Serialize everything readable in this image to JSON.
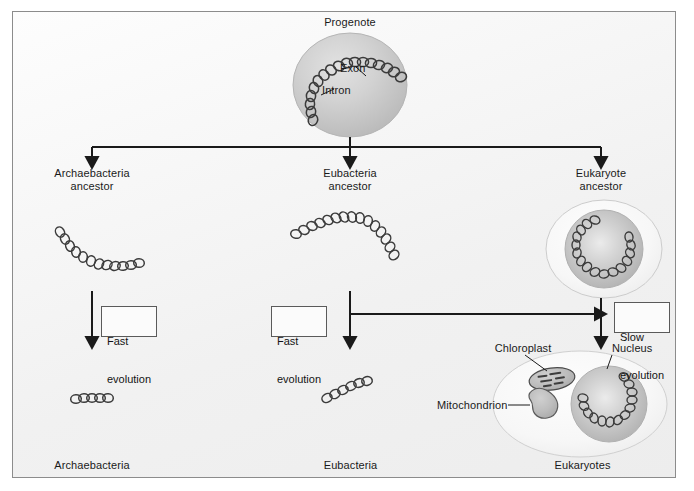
{
  "diagram": {
    "background_color": "#f2f2f2",
    "frame_border_color": "#8c8c8c",
    "arrow_color": "#1a1a1a",
    "cell_fill_color": "#c9c9c9",
    "dna_color": "#3a3a3a"
  },
  "root": {
    "label": "Progenote",
    "parts": [
      {
        "name": "exon",
        "label": "Exon"
      },
      {
        "name": "intron",
        "label": "Intron"
      }
    ]
  },
  "branches": [
    {
      "id": "archaebacteria",
      "ancestor_label": "Archaebacteria\nancestor",
      "ancestor_line1": "Archaebacteria",
      "ancestor_line2": "ancestor",
      "evolution_label": "Fast\nevolution",
      "evolution_line1": "Fast",
      "evolution_line2": "evolution",
      "descendant_label": "Archaebacteria"
    },
    {
      "id": "eubacteria",
      "ancestor_label": "Eubacteria\nancestor",
      "ancestor_line1": "Eubacteria",
      "ancestor_line2": "ancestor",
      "evolution_label": "Fast\nevolution",
      "evolution_line1": "Fast",
      "evolution_line2": "evolution",
      "descendant_label": "Eubacteria"
    },
    {
      "id": "eukaryote",
      "ancestor_label": "Eukaryote\nancestor",
      "ancestor_line1": "Eukaryote",
      "ancestor_line2": "ancestor",
      "evolution_label": "Slow\nevolution",
      "evolution_line1": "Slow",
      "evolution_line2": "evolution",
      "descendant_label": "Eukaryotes"
    }
  ],
  "eukaryote_cell": {
    "organelles": [
      {
        "name": "chloroplast",
        "label": "Chloroplast"
      },
      {
        "name": "mitochondrion",
        "label": "Mitochondrion"
      },
      {
        "name": "nucleus",
        "label": "Nucleus"
      }
    ]
  }
}
